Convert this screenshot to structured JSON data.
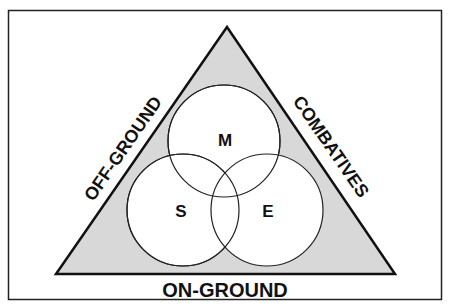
{
  "diagram": {
    "frame": {
      "x": 8,
      "y": 10,
      "width": 434,
      "height": 290,
      "stroke": "#222222"
    },
    "triangle": {
      "apex": [
        227,
        27
      ],
      "bottom_left": [
        56,
        274
      ],
      "bottom_right": [
        395,
        274
      ],
      "fill": "#d8d8d8",
      "stroke": "#111111"
    },
    "circles": [
      {
        "id": "M",
        "label": "M",
        "cx": 224,
        "cy": 141,
        "r": 56
      },
      {
        "id": "S",
        "label": "S",
        "cx": 183,
        "cy": 210,
        "r": 56
      },
      {
        "id": "E",
        "label": "E",
        "cx": 267,
        "cy": 210,
        "r": 56
      }
    ],
    "sides": {
      "left": "OFF-GROUND",
      "right": "COMBATIVES",
      "bottom": "ON-GROUND"
    }
  }
}
